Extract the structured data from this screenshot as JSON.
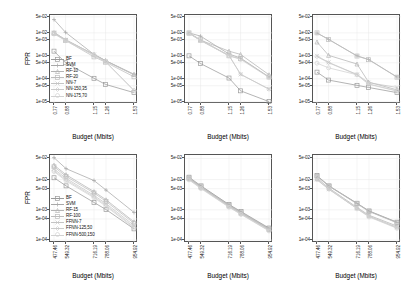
{
  "figure": {
    "title": "",
    "rows": 2,
    "cols": 3,
    "axis_label_x": "Budget (Mbits)",
    "axis_label_y": "FPR"
  },
  "markers": {
    "square": "square-marker",
    "plus": "plus-marker",
    "triangle": "triangle-marker",
    "circle": "circle-marker",
    "diamond": "diamond-marker",
    "star": "star-marker",
    "cross": "cross-marker"
  },
  "colors": {
    "series": [
      "#9b9b9b",
      "#a8a8a8",
      "#b4b4b4",
      "#bdbdbd",
      "#c4c4c4",
      "#cbcbcb",
      "#d2d2d2"
    ],
    "axis": "#555555",
    "grid": "#e8e8e8",
    "text": "#111111",
    "background": "#ffffff"
  },
  "chart_data": [
    {
      "type": "line",
      "id": "panel-top-left",
      "title": "",
      "xlabel": "Budget (Mbits)",
      "ylabel": "FPR",
      "xticklabels": [
        "0.77",
        "0.88",
        "1.15",
        "1.26",
        "1.53"
      ],
      "x": [
        0.77,
        0.88,
        1.15,
        1.26,
        1.53
      ],
      "yticklabels": [
        "5e-02",
        "1e-02",
        "5e-03",
        "1e-03",
        "5e-04",
        "1e-04",
        "5e-05",
        "1e-05"
      ],
      "ytickvalues": [
        0.05,
        0.01,
        0.005,
        0.001,
        0.0005,
        0.0001,
        5e-05,
        1e-05
      ],
      "ylim": [
        8e-06,
        0.06
      ],
      "yscale": "log",
      "grid": true,
      "legend": "inside-lower-left",
      "series": [
        {
          "name": "BF",
          "marker": "square",
          "values": [
            0.0016,
            0.0005,
            0.000105,
            5.7e-05,
            2.5e-05
          ]
        },
        {
          "name": "SVM",
          "marker": "plus",
          "values": [
            0.038,
            0.0105,
            0.00115,
            0.00062,
            0.000155
          ]
        },
        {
          "name": "RF-10",
          "marker": "triangle",
          "values": [
            0.0105,
            0.005,
            0.00115,
            0.00062,
            0.000155
          ]
        },
        {
          "name": "RF-20",
          "marker": "square",
          "values": [
            0.0095,
            0.0047,
            0.0009,
            0.00053,
            0.000122
          ]
        },
        {
          "name": "NN-7",
          "marker": "cross",
          "values": [
            0.0105,
            0.005,
            0.00115,
            0.00058,
            0.00015
          ]
        },
        {
          "name": "NN-150,35",
          "marker": "diamond",
          "values": [
            0.0098,
            0.0049,
            0.0011,
            0.00056,
            3.2e-05
          ]
        },
        {
          "name": "NN-175,70",
          "marker": "circle",
          "values": [
            0.009,
            0.0046,
            0.00105,
            0.00054,
            3e-05
          ]
        }
      ]
    },
    {
      "type": "line",
      "id": "panel-top-middle",
      "title": "",
      "xlabel": "Budget (Mbits)",
      "ylabel": "",
      "xticklabels": [
        "0.77",
        "0.88",
        "1.15",
        "1.26",
        "1.53"
      ],
      "x": [
        0.77,
        0.88,
        1.15,
        1.26,
        1.53
      ],
      "yticklabels": [
        "5e-02",
        "1e-02",
        "5e-03",
        "1e-03",
        "5e-04",
        "1e-04",
        "5e-05",
        "1e-05"
      ],
      "ytickvalues": [
        0.05,
        0.01,
        0.005,
        0.001,
        0.0005,
        0.0001,
        5e-05,
        1e-05
      ],
      "ylim": [
        8e-06,
        0.06
      ],
      "yscale": "log",
      "grid": true,
      "legend": "none",
      "series": [
        {
          "name": "BF",
          "marker": "square",
          "values": [
            0.001,
            0.00046,
            0.000108,
            3e-05,
            1.02e-05
          ]
        },
        {
          "name": "SVM",
          "marker": "plus",
          "values": [
            0.01,
            0.0072,
            0.0012,
            0.0008,
            0.00012
          ]
        },
        {
          "name": "RF-10",
          "marker": "triangle",
          "values": [
            0.0098,
            0.0048,
            0.0016,
            0.00115,
            0.00015
          ]
        },
        {
          "name": "RF-20",
          "marker": "square",
          "values": [
            0.01,
            0.005,
            0.001,
            0.00075,
            0.00012
          ]
        },
        {
          "name": "NN-7",
          "marker": "cross",
          "values": [
            0.0097,
            0.0047,
            0.00105,
            0.000155,
            3.6e-05
          ]
        },
        {
          "name": "NN-150,35",
          "marker": "diamond",
          "values": [
            0.0096,
            0.0047,
            0.00102,
            0.00016,
            3.5e-05
          ]
        },
        {
          "name": "NN-175,70",
          "marker": "circle",
          "values": [
            0.0095,
            0.0046,
            0.001,
            0.0007,
            0.000115
          ]
        }
      ]
    },
    {
      "type": "line",
      "id": "panel-top-right",
      "title": "",
      "xlabel": "Budget (Mbits)",
      "ylabel": "",
      "xticklabels": [
        "0.77",
        "0.88",
        "1.15",
        "1.26",
        "1.53"
      ],
      "x": [
        0.77,
        0.88,
        1.15,
        1.26,
        1.53
      ],
      "yticklabels": [
        "5e-02",
        "1e-02",
        "5e-03",
        "1e-03",
        "5e-04",
        "1e-04",
        "5e-05",
        "1e-05"
      ],
      "ytickvalues": [
        0.05,
        0.01,
        0.005,
        0.001,
        0.0005,
        0.0001,
        5e-05,
        1e-05
      ],
      "ylim": [
        8e-06,
        0.06
      ],
      "yscale": "log",
      "grid": true,
      "legend": "none",
      "series": [
        {
          "name": "BF",
          "marker": "square",
          "values": [
            0.000195,
            8.8e-05,
            5.2e-05,
            4.2e-05,
            2.5e-05
          ]
        },
        {
          "name": "SVM",
          "marker": "plus",
          "values": [
            0.0098,
            0.0052,
            0.001,
            0.0007,
            0.00012
          ]
        },
        {
          "name": "RF-10",
          "marker": "triangle",
          "values": [
            0.004,
            0.00105,
            0.00044,
            7.2e-05,
            3.3e-05
          ]
        },
        {
          "name": "RF-20",
          "marker": "square",
          "values": [
            0.01,
            0.0052,
            0.00098,
            0.00068,
            0.000118
          ]
        },
        {
          "name": "NN-7",
          "marker": "cross",
          "values": [
            0.001,
            0.00052,
            0.000155,
            6.8e-05,
            4.2e-05
          ]
        },
        {
          "name": "NN-150,35",
          "marker": "diamond",
          "values": [
            0.00092,
            0.0005,
            0.00015,
            6e-05,
            3e-05
          ]
        },
        {
          "name": "NN-175,70",
          "marker": "circle",
          "values": [
            0.00048,
            0.0003,
            0.00015,
            5.8e-05,
            2.9e-05
          ]
        }
      ]
    },
    {
      "type": "line",
      "id": "panel-bottom-left",
      "title": "",
      "xlabel": "Budget (Mbits)",
      "ylabel": "FPR",
      "xticklabels": [
        "477.46",
        "549.32",
        "716.19",
        "788.06",
        "954.92"
      ],
      "x": [
        477.46,
        549.32,
        716.19,
        788.06,
        954.92
      ],
      "yticklabels": [
        "5e-02",
        "1e-02",
        "5e-03",
        "1e-03",
        "5e-04",
        "1e-04"
      ],
      "ytickvalues": [
        0.05,
        0.01,
        0.005,
        0.001,
        0.0005,
        0.0001
      ],
      "ylim": [
        8e-05,
        0.065
      ],
      "yscale": "log",
      "grid": true,
      "legend": "inside-lower-left",
      "series": [
        {
          "name": "BF",
          "marker": "square",
          "values": [
            0.0115,
            0.0062,
            0.00175,
            0.00102,
            0.000235
          ]
        },
        {
          "name": "SVM",
          "marker": "plus",
          "values": [
            0.053,
            0.023,
            0.0093,
            0.0045,
            0.00082
          ]
        },
        {
          "name": "RF-15",
          "marker": "triangle",
          "values": [
            0.03,
            0.0145,
            0.004,
            0.00215,
            0.0004
          ]
        },
        {
          "name": "RF-100",
          "marker": "square",
          "values": [
            0.0265,
            0.0128,
            0.0036,
            0.0019,
            0.00036
          ]
        },
        {
          "name": "FFNN-7",
          "marker": "cross",
          "values": [
            0.0225,
            0.011,
            0.003,
            0.0016,
            0.000305
          ]
        },
        {
          "name": "FFNN-125,50",
          "marker": "diamond",
          "values": [
            0.02,
            0.0098,
            0.0027,
            0.00142,
            0.00027
          ]
        },
        {
          "name": "FFNN-500,150",
          "marker": "circle",
          "values": [
            0.0185,
            0.009,
            0.0025,
            0.0013,
            0.00025
          ]
        }
      ]
    },
    {
      "type": "line",
      "id": "panel-bottom-middle",
      "title": "",
      "xlabel": "Budget (Mbits)",
      "ylabel": "",
      "xticklabels": [
        "477.46",
        "549.32",
        "716.19",
        "788.06",
        "954.92"
      ],
      "x": [
        477.46,
        549.32,
        716.19,
        788.06,
        954.92
      ],
      "yticklabels": [
        "5e-02",
        "1e-02",
        "5e-03",
        "1e-03",
        "5e-04",
        "1e-04"
      ],
      "ytickvalues": [
        0.05,
        0.01,
        0.005,
        0.001,
        0.0005,
        0.0001
      ],
      "ylim": [
        8e-05,
        0.065
      ],
      "yscale": "log",
      "grid": true,
      "legend": "none",
      "series": [
        {
          "name": "BF",
          "marker": "square",
          "values": [
            0.012,
            0.0062,
            0.0015,
            0.00088,
            0.00025
          ]
        },
        {
          "name": "SVM",
          "marker": "plus",
          "values": [
            0.0115,
            0.006,
            0.00145,
            0.00084,
            0.00024
          ]
        },
        {
          "name": "RF-15",
          "marker": "triangle",
          "values": [
            0.0108,
            0.0056,
            0.00135,
            0.00078,
            0.000225
          ]
        },
        {
          "name": "RF-100",
          "marker": "square",
          "values": [
            0.0112,
            0.0058,
            0.0014,
            0.0008,
            0.00023
          ]
        },
        {
          "name": "FFNN-7",
          "marker": "cross",
          "values": [
            0.0105,
            0.0054,
            0.0013,
            0.00075,
            0.000215
          ]
        },
        {
          "name": "FFNN-125,50",
          "marker": "diamond",
          "values": [
            0.01,
            0.0052,
            0.00125,
            0.00072,
            0.000205
          ]
        },
        {
          "name": "FFNN-500,150",
          "marker": "circle",
          "values": [
            0.0098,
            0.005,
            0.00122,
            0.0007,
            0.0002
          ]
        }
      ]
    },
    {
      "type": "line",
      "id": "panel-bottom-right",
      "title": "",
      "xlabel": "Budget (Mbits)",
      "ylabel": "",
      "xticklabels": [
        "477.46",
        "549.32",
        "716.19",
        "788.06",
        "954.92"
      ],
      "x": [
        477.46,
        549.32,
        716.19,
        788.06,
        954.92
      ],
      "yticklabels": [
        "5e-02",
        "1e-02",
        "5e-03",
        "1e-03",
        "5e-04",
        "1e-04"
      ],
      "ytickvalues": [
        0.05,
        0.01,
        0.005,
        0.001,
        0.0005,
        0.0001
      ],
      "ylim": [
        8e-05,
        0.065
      ],
      "yscale": "log",
      "grid": true,
      "legend": "none",
      "series": [
        {
          "name": "BF",
          "marker": "square",
          "values": [
            0.0135,
            0.0062,
            0.00165,
            0.00092,
            0.00039
          ]
        },
        {
          "name": "SVM",
          "marker": "plus",
          "values": [
            0.0132,
            0.0061,
            0.00162,
            0.0009,
            0.00038
          ]
        },
        {
          "name": "RF-15",
          "marker": "triangle",
          "values": [
            0.011,
            0.0052,
            0.0012,
            0.00066,
            0.00029
          ]
        },
        {
          "name": "RF-100",
          "marker": "square",
          "values": [
            0.0128,
            0.006,
            0.00158,
            0.00088,
            0.00037
          ]
        },
        {
          "name": "FFNN-7",
          "marker": "cross",
          "values": [
            0.01,
            0.0048,
            0.00112,
            0.00062,
            0.000265
          ]
        },
        {
          "name": "FFNN-125,50",
          "marker": "diamond",
          "values": [
            0.0098,
            0.0047,
            0.0011,
            0.0006,
            0.000255
          ]
        },
        {
          "name": "FFNN-500,150",
          "marker": "circle",
          "values": [
            0.0118,
            0.005,
            0.00108,
            0.00058,
            0.000245
          ]
        }
      ]
    }
  ]
}
